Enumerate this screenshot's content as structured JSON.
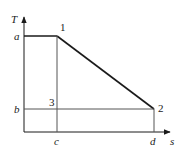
{
  "diagram": {
    "type": "T-s diagram",
    "axes": {
      "y_label": "T",
      "x_label": "s"
    },
    "tick_labels": {
      "a": "a",
      "b": "b",
      "c": "c",
      "d": "d"
    },
    "points": [
      {
        "id": "1",
        "label": "1"
      },
      {
        "id": "2",
        "label": "2"
      },
      {
        "id": "3",
        "label": "3"
      }
    ],
    "colors": {
      "line": "#1a1a1a",
      "thin_line": "#555555",
      "background": "#ffffff"
    }
  }
}
